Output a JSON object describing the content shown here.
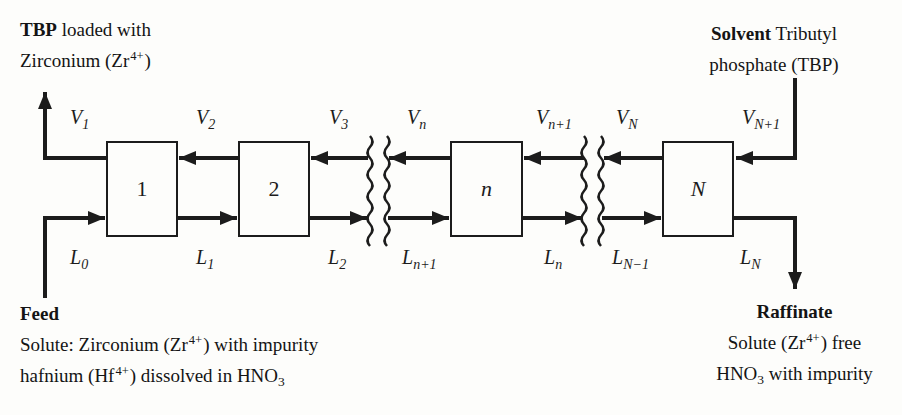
{
  "corners": {
    "tbp_out": {
      "bold": "TBP",
      "after": " loaded with",
      "line2_pre": "Zirconium (Zr",
      "line2_sup": "4+",
      "line2_post": ")"
    },
    "solvent_in": {
      "bold": "Solvent",
      "after": " Tributyl",
      "line2": "phosphate (TBP)"
    },
    "feed": {
      "title": "Feed",
      "line2_pre": "Solute: Zirconium (Zr",
      "line2_sup": "4+",
      "line2_post": ") with impurity",
      "line3_pre": "hafnium (Hf",
      "line3_sup": "4+",
      "line3_mid": ") dissolved in HNO",
      "line3_sub": "3"
    },
    "raffinate": {
      "title": "Raffinate",
      "line2_pre": "Solute (Zr",
      "line2_sup": "4+",
      "line2_post": ") free",
      "line3_pre": "HNO",
      "line3_sub": "3",
      "line3_post": " with impurity"
    }
  },
  "stages": [
    {
      "label": "1"
    },
    {
      "label": "2"
    },
    {
      "label": "n"
    },
    {
      "label": "N"
    }
  ],
  "v_labels": [
    {
      "base": "V",
      "sub": "1"
    },
    {
      "base": "V",
      "sub": "2"
    },
    {
      "base": "V",
      "sub": "3"
    },
    {
      "base": "V",
      "sub": "n"
    },
    {
      "base": "V",
      "sub": "n+1"
    },
    {
      "base": "V",
      "sub": "N"
    },
    {
      "base": "V",
      "sub": "N+1"
    }
  ],
  "l_labels": [
    {
      "base": "L",
      "sub": "0"
    },
    {
      "base": "L",
      "sub": "1"
    },
    {
      "base": "L",
      "sub": "2"
    },
    {
      "base": "L",
      "sub": "n+1"
    },
    {
      "base": "L",
      "sub": "n"
    },
    {
      "base": "L",
      "sub": "N−1"
    },
    {
      "base": "L",
      "sub": "N"
    }
  ],
  "colors": {
    "ink": "#1c1c1c",
    "paper": "#fdfdfb"
  }
}
